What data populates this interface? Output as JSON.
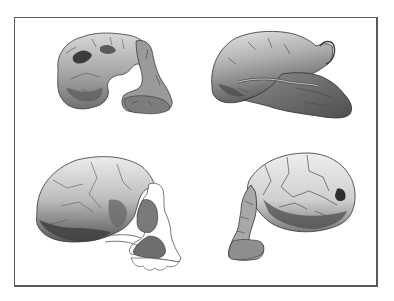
{
  "figure": {
    "description": "Plate of four hominin skull illustrations in lateral view, arranged in a 2x2 grid inside a rectangular frame",
    "frame_color": "#5a5a5a",
    "background_color": "#ffffff",
    "panels": [
      {
        "position": "top-left",
        "subject": "fragmentary-skull",
        "facing": "right",
        "tone": "medium-gray stippled"
      },
      {
        "position": "top-right",
        "subject": "robust-skull-with-projecting-face",
        "facing": "right",
        "tone": "dark-gray stippled"
      },
      {
        "position": "bottom-left",
        "subject": "rounded-cranium-with-reconstructed-jaw",
        "facing": "right",
        "tone": "light-to-medium gray stippled"
      },
      {
        "position": "bottom-right",
        "subject": "cracked-cranium-with-face",
        "facing": "left",
        "tone": "light gray stippled"
      }
    ]
  }
}
